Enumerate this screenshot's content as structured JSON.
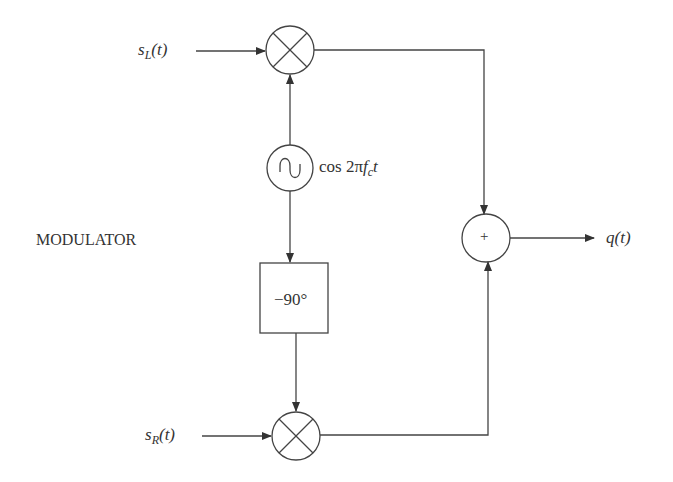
{
  "diagram": {
    "title": "MODULATOR",
    "inputs": {
      "left": {
        "sym": "s",
        "sub": "L",
        "arg": "(t)"
      },
      "right": {
        "sym": "s",
        "sub": "R",
        "arg": "(t)"
      }
    },
    "oscillator": {
      "label_pre": "cos 2π",
      "f": "f",
      "fsub": "c",
      "t": "t",
      "icon": "sine-wave-icon"
    },
    "phase_shifter": {
      "label": "−90°"
    },
    "adder": {
      "symbol": "+"
    },
    "output": {
      "label": "q(t)"
    },
    "multipliers": {
      "symbol": "×"
    },
    "colors": {
      "stroke": "#444444",
      "background": "#ffffff"
    }
  }
}
